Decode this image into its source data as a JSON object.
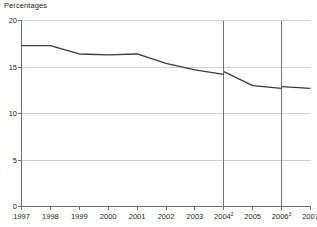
{
  "chart_data": {
    "type": "line",
    "title": "Percentages",
    "xlabel": "",
    "ylabel": "Percentages",
    "categories": [
      "1997",
      "1998",
      "1999",
      "2000",
      "2001",
      "2002",
      "2003",
      "2004",
      "2005",
      "2006",
      "2007"
    ],
    "tick_labels": [
      {
        "label": "1997",
        "superscript": ""
      },
      {
        "label": "1998",
        "superscript": ""
      },
      {
        "label": "1999",
        "superscript": ""
      },
      {
        "label": "2000",
        "superscript": ""
      },
      {
        "label": "2001",
        "superscript": ""
      },
      {
        "label": "2002",
        "superscript": ""
      },
      {
        "label": "2003",
        "superscript": ""
      },
      {
        "label": "2004",
        "superscript": "2"
      },
      {
        "label": "2005",
        "superscript": ""
      },
      {
        "label": "2006",
        "superscript": "3"
      },
      {
        "label": "2007",
        "superscript": ""
      }
    ],
    "series": [
      {
        "name": "Percentage",
        "values": [
          17.3,
          17.3,
          16.4,
          16.3,
          16.4,
          15.4,
          14.7,
          14.2,
          13.0,
          12.7,
          12.7
        ],
        "break_values": {
          "2004": 14.5,
          "2006": 12.9
        },
        "color": "#3a3a3a"
      }
    ],
    "segments": [
      [
        {
          "x": "1997",
          "y": 17.3
        },
        {
          "x": "1998",
          "y": 17.3
        },
        {
          "x": "1999",
          "y": 16.4
        },
        {
          "x": "2000",
          "y": 16.3
        },
        {
          "x": "2001",
          "y": 16.4
        },
        {
          "x": "2002",
          "y": 15.4
        },
        {
          "x": "2003",
          "y": 14.7
        },
        {
          "x": "2004",
          "y": 14.2
        }
      ],
      [
        {
          "x": "2004",
          "y": 14.5
        },
        {
          "x": "2005",
          "y": 13.0
        },
        {
          "x": "2006",
          "y": 12.7
        }
      ],
      [
        {
          "x": "2006",
          "y": 12.9
        },
        {
          "x": "2007",
          "y": 12.7
        }
      ]
    ],
    "ylim": [
      0,
      20
    ],
    "yticks": [
      0,
      5,
      10,
      15,
      20
    ],
    "ytick_labels": [
      "0",
      "5",
      "10",
      "15",
      "20"
    ],
    "grid": true,
    "grid_color": "#cfcfcf",
    "axis_color": "#6e6e6e",
    "break_lines": [
      "2004",
      "2006"
    ],
    "legend": "none"
  }
}
